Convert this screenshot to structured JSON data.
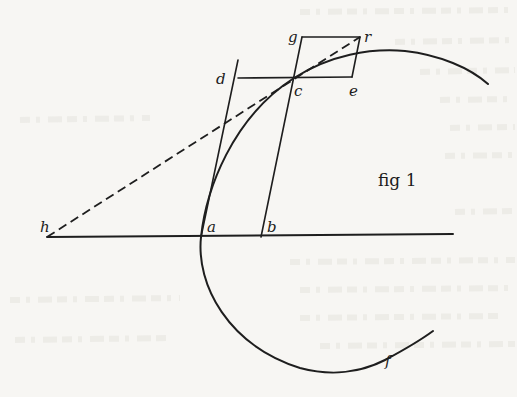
{
  "figure": {
    "caption": "fig 1",
    "points": {
      "h": {
        "label": "h",
        "x": 47,
        "y": 237
      },
      "a": {
        "label": "a",
        "x": 201,
        "y": 237
      },
      "b": {
        "label": "b",
        "x": 261,
        "y": 237
      },
      "c": {
        "label": "c",
        "x": 294,
        "y": 78
      },
      "d": {
        "label": "d",
        "x": 238,
        "y": 60
      },
      "g": {
        "label": "g",
        "x": 302,
        "y": 37
      },
      "r": {
        "label": "r",
        "x": 360,
        "y": 37
      },
      "e": {
        "label": "e",
        "x": 352,
        "y": 77
      },
      "f": {
        "label": "f",
        "x": 390,
        "y": 358
      }
    },
    "segments": [
      {
        "name": "baseline-h-to-end",
        "from": "h",
        "to": [
          453,
          234
        ],
        "style": "solid"
      },
      {
        "name": "line-a-to-d",
        "from": "a",
        "to": "d",
        "style": "solid"
      },
      {
        "name": "line-b-to-g",
        "from": "b",
        "to": "g",
        "style": "solid"
      },
      {
        "name": "line-d-to-e",
        "from": "d",
        "to": "e",
        "style": "solid"
      },
      {
        "name": "line-g-to-r",
        "from": "g",
        "to": "r",
        "style": "solid"
      },
      {
        "name": "line-r-to-e",
        "from": "r",
        "to": "e",
        "style": "solid"
      },
      {
        "name": "dashed-h-to-r",
        "from": "h",
        "to": "r",
        "style": "dashed"
      }
    ],
    "curves": [
      {
        "name": "upper-arc",
        "from": "a",
        "through": [
          "c"
        ],
        "to": [
          488,
          84
        ]
      },
      {
        "name": "lower-arc",
        "from": "a",
        "through": [
          "f"
        ],
        "to": [
          433,
          331
        ]
      }
    ],
    "colors": {
      "ink": "#1e1e1e",
      "paper": "#f7f6f3"
    }
  }
}
